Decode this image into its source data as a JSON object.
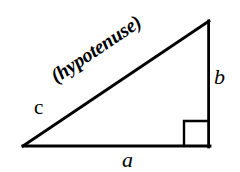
{
  "figure": {
    "kind": "right-triangle-diagram",
    "title": "",
    "background_color": "#ffffff",
    "stroke_color": "#000000",
    "geometry": {
      "left_vertex": {
        "x": 23,
        "y": 146
      },
      "right_angle_vertex": {
        "x": 209,
        "y": 146
      },
      "apex_vertex": {
        "x": 209,
        "y": 21
      },
      "base_length_px": 186,
      "height_length_px": 125,
      "hypotenuse_angle_deg": -33.9,
      "line_width_px": 2.6,
      "right_angle_marker": {
        "x": 184,
        "y": 121,
        "size": 25,
        "line_width_px": 2.2
      }
    },
    "labels": {
      "hypotenuse_side": "c",
      "base_side": "a",
      "vertical_side": "b",
      "hypotenuse_word": "(hypotenuse)"
    }
  }
}
